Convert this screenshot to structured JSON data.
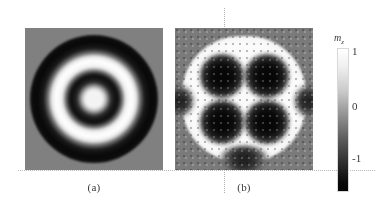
{
  "figure": {
    "background_color": "#ffffff",
    "panels": [
      {
        "id": "a",
        "caption": "(a)",
        "description": "target-skyrmion concentric ring magnetization pattern"
      },
      {
        "id": "b",
        "caption": "(b)",
        "description": "four-lobe quadrupole magnetization pattern with discrete spin grid"
      }
    ]
  },
  "colorbar": {
    "title": "m",
    "title_subscript": "z",
    "ticks": [
      "1",
      "0",
      "-1"
    ],
    "min": -1,
    "max": 1,
    "low_color": "#000000",
    "mid_color": "#808080",
    "high_color": "#ffffff"
  },
  "chart_data": {
    "type": "heatmap",
    "title": "",
    "subtitle": "",
    "xlabel": "",
    "ylabel": "",
    "colorbar_label": "m_z",
    "colorbar_ticks": [
      1,
      0,
      -1
    ],
    "zlim": [
      -1,
      1
    ],
    "colormap": "grayscale (black = -1, gray = 0, white = +1)",
    "grid": false,
    "legend": "colorbar, right",
    "panels": [
      {
        "label": "(a)",
        "pattern": "concentric rings (target state)",
        "radial_profile": {
          "description": "m_z sampled along radius from disk center to edge, normalized radius 0-1",
          "r": [
            0.0,
            0.1,
            0.2,
            0.25,
            0.3,
            0.35,
            0.4,
            0.45,
            0.5,
            0.55,
            0.6,
            0.65,
            0.7,
            0.8,
            0.9,
            1.0
          ],
          "m_z": [
            1.0,
            0.95,
            -0.2,
            -0.9,
            -1.0,
            -0.6,
            0.4,
            0.95,
            1.0,
            0.9,
            0.2,
            -0.7,
            -1.0,
            -0.95,
            -0.4,
            0.0
          ]
        },
        "ring_count": 4,
        "ring_colors": [
          "white",
          "black",
          "white",
          "black"
        ],
        "background_m_z": 0.0
      },
      {
        "label": "(b)",
        "pattern": "four-lobe quadrupole on bright disk",
        "lobes": [
          {
            "position": "top-left",
            "cx": -0.26,
            "cy": 0.26,
            "m_z": -1.0
          },
          {
            "position": "top-right",
            "cx": 0.26,
            "cy": 0.26,
            "m_z": -1.0
          },
          {
            "position": "bottom-left",
            "cx": -0.26,
            "cy": -0.26,
            "m_z": -1.0
          },
          {
            "position": "bottom-right",
            "cx": 0.26,
            "cy": -0.26,
            "m_z": -1.0
          }
        ],
        "disk_m_z": 1.0,
        "background_m_z": -0.05,
        "edge_features": [
          {
            "position": "bottom",
            "m_z": -0.85
          },
          {
            "position": "left",
            "m_z": -0.7
          },
          {
            "position": "right",
            "m_z": -0.7
          }
        ],
        "overlay": "discrete simulation cell / spin vector grid"
      }
    ]
  }
}
